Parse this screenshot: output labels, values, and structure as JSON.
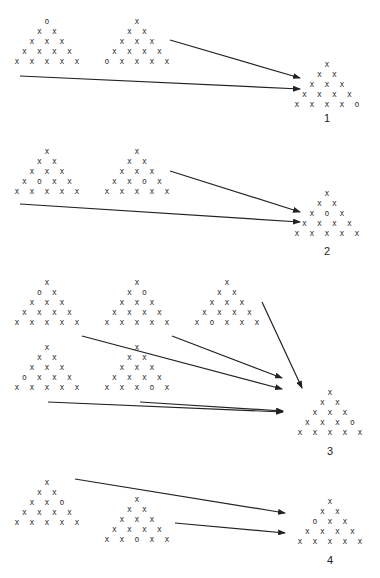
{
  "colors": {
    "background": "#ffffff",
    "symbol": "#333333",
    "arrow": "#222222"
  },
  "symbols": {
    "cross": "x",
    "circle": "o"
  },
  "groups": [
    {
      "label": "1",
      "sources": [
        {
          "id": "1a",
          "apex": [
            47,
            22
          ],
          "rows": [
            [
              "o"
            ],
            [
              "x",
              "x"
            ],
            [
              "x",
              "x",
              "x"
            ],
            [
              "x",
              "x",
              "x",
              "x"
            ],
            [
              "x",
              "x",
              "x",
              "x",
              "x"
            ]
          ]
        },
        {
          "id": "1b",
          "apex": [
            137,
            22
          ],
          "rows": [
            [
              "x"
            ],
            [
              "x",
              "x"
            ],
            [
              "x",
              "x",
              "x"
            ],
            [
              "x",
              "x",
              "x",
              "x"
            ],
            [
              "o",
              "x",
              "x",
              "x",
              "x"
            ]
          ]
        }
      ],
      "target": {
        "apex": [
          327,
          65
        ],
        "rows": [
          [
            "x"
          ],
          [
            "x",
            "x"
          ],
          [
            "x",
            "x",
            "x"
          ],
          [
            "x",
            "x",
            "x",
            "x"
          ],
          [
            "x",
            "x",
            "x",
            "x",
            "o"
          ]
        ]
      },
      "label_pos": [
        327,
        112
      ],
      "arrows": [
        [
          170,
          40,
          300,
          78
        ],
        [
          20,
          76,
          300,
          89
        ]
      ]
    },
    {
      "label": "2",
      "sources": [
        {
          "id": "2a",
          "apex": [
            47,
            152
          ],
          "rows": [
            [
              "x"
            ],
            [
              "x",
              "x"
            ],
            [
              "x",
              "x",
              "x"
            ],
            [
              "x",
              "o",
              "x",
              "x"
            ],
            [
              "x",
              "x",
              "x",
              "x",
              "x"
            ]
          ]
        },
        {
          "id": "2b",
          "apex": [
            137,
            152
          ],
          "rows": [
            [
              "x"
            ],
            [
              "x",
              "x"
            ],
            [
              "x",
              "x",
              "x"
            ],
            [
              "x",
              "x",
              "o",
              "x"
            ],
            [
              "x",
              "x",
              "x",
              "x",
              "x"
            ]
          ]
        }
      ],
      "target": {
        "apex": [
          327,
          194
        ],
        "rows": [
          [
            "x"
          ],
          [
            "x",
            "x"
          ],
          [
            "x",
            "o",
            "x"
          ],
          [
            "x",
            "x",
            "x",
            "x"
          ],
          [
            "x",
            "x",
            "x",
            "x",
            "x"
          ]
        ]
      },
      "label_pos": [
        327,
        245
      ],
      "arrows": [
        [
          170,
          171,
          300,
          212
        ],
        [
          20,
          204,
          300,
          222
        ]
      ]
    },
    {
      "label": "3",
      "sources": [
        {
          "id": "3a",
          "apex": [
            47,
            283
          ],
          "rows": [
            [
              "x"
            ],
            [
              "o",
              "x"
            ],
            [
              "x",
              "x",
              "x"
            ],
            [
              "x",
              "x",
              "x",
              "x"
            ],
            [
              "x",
              "x",
              "x",
              "x",
              "x"
            ]
          ]
        },
        {
          "id": "3b",
          "apex": [
            137,
            283
          ],
          "rows": [
            [
              "x"
            ],
            [
              "x",
              "o"
            ],
            [
              "x",
              "x",
              "x"
            ],
            [
              "x",
              "x",
              "x",
              "x"
            ],
            [
              "x",
              "x",
              "x",
              "x",
              "x"
            ]
          ]
        },
        {
          "id": "3c",
          "apex": [
            227,
            283
          ],
          "rows": [
            [
              "x"
            ],
            [
              "x",
              "x"
            ],
            [
              "x",
              "x",
              "x"
            ],
            [
              "x",
              "x",
              "x",
              "x"
            ],
            [
              "x",
              "o",
              "x",
              "x",
              "x"
            ]
          ]
        },
        {
          "id": "3d",
          "apex": [
            47,
            348
          ],
          "rows": [
            [
              "x"
            ],
            [
              "x",
              "x"
            ],
            [
              "x",
              "x",
              "x"
            ],
            [
              "o",
              "x",
              "x",
              "x"
            ],
            [
              "x",
              "x",
              "x",
              "x",
              "x"
            ]
          ]
        },
        {
          "id": "3e",
          "apex": [
            137,
            348
          ],
          "rows": [
            [
              "x"
            ],
            [
              "x",
              "x"
            ],
            [
              "x",
              "x",
              "x"
            ],
            [
              "x",
              "x",
              "x",
              "x"
            ],
            [
              "x",
              "x",
              "x",
              "o",
              "x"
            ]
          ]
        }
      ],
      "target": {
        "apex": [
          330,
          393
        ],
        "rows": [
          [
            "x"
          ],
          [
            "x",
            "x"
          ],
          [
            "x",
            "x",
            "x"
          ],
          [
            "x",
            "x",
            "x",
            "o"
          ],
          [
            "x",
            "x",
            "x",
            "x",
            "x"
          ]
        ]
      },
      "label_pos": [
        330,
        445
      ],
      "arrows": [
        [
          262,
          302,
          302,
          388
        ],
        [
          172,
          336,
          282,
          378
        ],
        [
          82,
          336,
          282,
          389
        ],
        [
          48,
          402,
          283,
          412
        ],
        [
          140,
          402,
          283,
          411
        ]
      ]
    },
    {
      "label": "4",
      "sources": [
        {
          "id": "4a",
          "apex": [
            47,
            483
          ],
          "rows": [
            [
              "x"
            ],
            [
              "x",
              "x"
            ],
            [
              "x",
              "x",
              "o"
            ],
            [
              "x",
              "x",
              "x",
              "x"
            ],
            [
              "x",
              "x",
              "x",
              "x",
              "x"
            ]
          ]
        },
        {
          "id": "4b",
          "apex": [
            137,
            500
          ],
          "rows": [
            [
              "x"
            ],
            [
              "x",
              "x"
            ],
            [
              "x",
              "x",
              "x"
            ],
            [
              "x",
              "x",
              "x",
              "x"
            ],
            [
              "x",
              "x",
              "o",
              "x",
              "x"
            ]
          ]
        }
      ],
      "target": {
        "apex": [
          330,
          502
        ],
        "rows": [
          [
            "x"
          ],
          [
            "x",
            "x"
          ],
          [
            "o",
            "x",
            "x"
          ],
          [
            "x",
            "x",
            "x",
            "x"
          ],
          [
            "x",
            "x",
            "x",
            "x",
            "x"
          ]
        ]
      },
      "label_pos": [
        330,
        554
      ],
      "arrows": [
        [
          75,
          479,
          285,
          513
        ],
        [
          175,
          523,
          285,
          533
        ]
      ]
    }
  ]
}
